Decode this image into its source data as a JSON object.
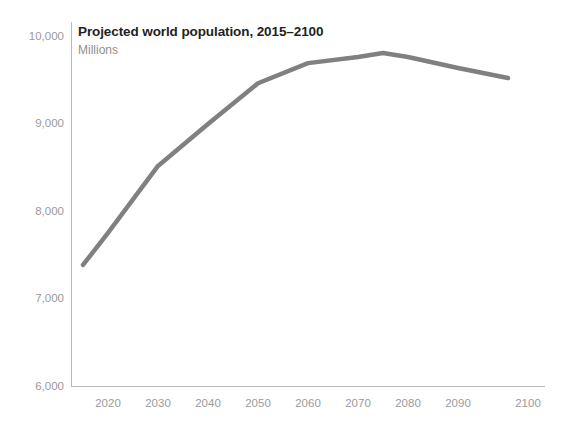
{
  "chart_data": {
    "type": "line",
    "title": "Projected world population, 2015–2100",
    "subtitle": "Millions",
    "xlabel": "",
    "ylabel": "",
    "grid": false,
    "legend": false,
    "line_color": "#808080",
    "text_color": "#231f20",
    "tick_color": "#9b9b9b",
    "axis_color": "#b9b9b9",
    "background": "#ffffff",
    "xlim": [
      2015,
      2100
    ],
    "ylim": [
      6000,
      10000
    ],
    "x_ticks": [
      "2020",
      "2030",
      "2040",
      "2050",
      "2060",
      "2070",
      "2080",
      "2090",
      "2100"
    ],
    "y_ticks": [
      "6,000",
      "7,000",
      "8,000",
      "9,000",
      "10,000"
    ],
    "x": [
      2015,
      2020,
      2030,
      2040,
      2050,
      2060,
      2070,
      2075,
      2080,
      2090,
      2100
    ],
    "values": [
      7383,
      7750,
      8515,
      8995,
      9460,
      9690,
      9760,
      9805,
      9760,
      9635,
      9520
    ],
    "series": [
      {
        "name": "Projected world population",
        "x": [
          2015,
          2020,
          2030,
          2040,
          2050,
          2060,
          2070,
          2075,
          2080,
          2090,
          2100
        ],
        "values": [
          7383,
          7750,
          8515,
          8995,
          9460,
          9690,
          9760,
          9805,
          9760,
          9635,
          9520
        ]
      }
    ]
  }
}
